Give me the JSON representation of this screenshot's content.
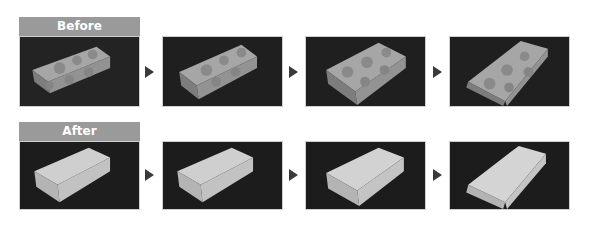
{
  "rows": [
    {
      "label": "Before",
      "description": "textured box with circular pattern on dark wood surface",
      "frames": 4,
      "box_fill": "#a9a9a9",
      "pattern": "circles"
    },
    {
      "label": "After",
      "description": "plain untextured white box on dark surface",
      "frames": 4,
      "box_fill": "#d0d0d0",
      "pattern": "none"
    }
  ],
  "arrow_icon": "triangle-right-icon",
  "colors": {
    "label_bg": "#9a9a9a",
    "label_text": "#ffffff",
    "scene_bg": "#1e1e1e",
    "arrow": "#3a3a3a"
  }
}
